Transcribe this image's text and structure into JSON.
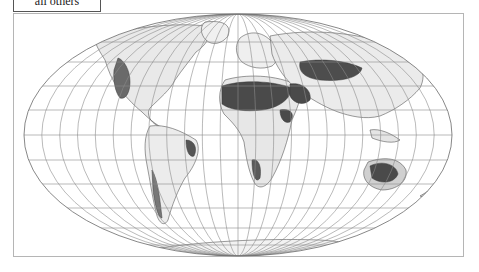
{
  "legend": {
    "visible_label": "all others"
  },
  "map": {
    "projection": "Mollweide (world)",
    "graticule_spacing_deg": 15,
    "colors": {
      "background": "#ffffff",
      "graticule": "#8c8c8c",
      "coastline": "#3a3a3a",
      "land_light": "#e6e6e6",
      "land_mid": "#a8a8a8",
      "land_dark": "#4a4a4a",
      "frame": "#b5b5b5"
    },
    "shaded_regions": [
      {
        "name": "Sahara / North Africa",
        "shade": "dark"
      },
      {
        "name": "Arabian Peninsula",
        "shade": "dark"
      },
      {
        "name": "Central Asia / Iran",
        "shade": "dark"
      },
      {
        "name": "Horn of Africa",
        "shade": "dark"
      },
      {
        "name": "Western North America",
        "shade": "mid"
      },
      {
        "name": "Eastern Brazil",
        "shade": "mid"
      },
      {
        "name": "Southern Africa (Namibia/Kalahari)",
        "shade": "mid"
      },
      {
        "name": "Australia interior",
        "shade": "dark"
      },
      {
        "name": "Patagonia / Andes",
        "shade": "mid"
      }
    ]
  }
}
